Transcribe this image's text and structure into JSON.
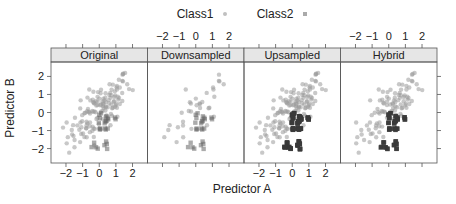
{
  "chart_data": {
    "type": "scatter",
    "title": "",
    "xlabel": "Predictor A",
    "ylabel": "Predictor B",
    "xlim": [
      -2.9,
      2.9
    ],
    "ylim": [
      -2.8,
      2.8
    ],
    "x_ticks": [
      "−2",
      "−1",
      "0",
      "1",
      "2"
    ],
    "x_tick_values": [
      -2,
      -1,
      0,
      1,
      2
    ],
    "y_ticks": [
      "−2",
      "−1",
      "0",
      "1",
      "2"
    ],
    "y_tick_values": [
      -2,
      -1,
      0,
      1,
      2
    ],
    "grid": false,
    "legend": {
      "position": "top",
      "entries": [
        {
          "label": "Class1",
          "marker": "circle",
          "color": "#a8a8a8"
        },
        {
          "label": "Class2",
          "marker": "square",
          "color": "#4a4a4a"
        }
      ]
    },
    "panels": [
      {
        "label": "Original",
        "x_axis_bottom": true,
        "x_axis_top": false,
        "class1_n": 140,
        "class2_n": 25,
        "class2_dup": 1
      },
      {
        "label": "Downsampled",
        "x_axis_bottom": false,
        "x_axis_top": true,
        "class1_n": 35,
        "class2_n": 25,
        "class2_dup": 1
      },
      {
        "label": "Upsampled",
        "x_axis_bottom": true,
        "x_axis_top": false,
        "class1_n": 140,
        "class2_n": 25,
        "class2_dup": 5
      },
      {
        "label": "Hybrid",
        "x_axis_bottom": false,
        "x_axis_top": true,
        "class1_n": 100,
        "class2_n": 25,
        "class2_dup": 3
      }
    ],
    "series": [
      {
        "name": "Class1",
        "description": "majority class, positively correlated cloud centered near (0,0)"
      },
      {
        "name": "Class2",
        "description": "minority class, clustered near (0.5,-0.5) and (0.3,-1.8)"
      }
    ]
  }
}
